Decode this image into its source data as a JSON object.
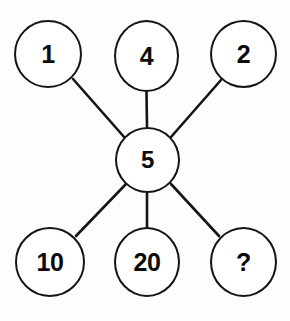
{
  "diagram": {
    "type": "hub-and-spoke",
    "canvas": {
      "width": 290,
      "height": 321,
      "background": "#fdfdfd"
    },
    "stroke_color": "#141414",
    "text_color": "#0b0b0b",
    "fill_color": "#ffffff",
    "center": {
      "id": "center",
      "label": "5",
      "cx": 147.5,
      "cy": 160
    },
    "outer_nodes": [
      {
        "id": "one",
        "label": "1",
        "position": "top-left",
        "cx": 48,
        "cy": 54
      },
      {
        "id": "four",
        "label": "4",
        "position": "top-center",
        "cx": 146.5,
        "cy": 56
      },
      {
        "id": "two",
        "label": "2",
        "position": "top-right",
        "cx": 243.5,
        "cy": 54
      },
      {
        "id": "ten",
        "label": "10",
        "position": "bottom-left",
        "cx": 50,
        "cy": 262
      },
      {
        "id": "twenty",
        "label": "20",
        "position": "bottom-center",
        "cx": 147,
        "cy": 262
      },
      {
        "id": "quest",
        "label": "?",
        "position": "bottom-right",
        "cx": 243.5,
        "cy": 262
      }
    ],
    "edges": [
      {
        "from": "one",
        "to": "center",
        "x1": 73,
        "y1": 79,
        "x2": 125,
        "y2": 138
      },
      {
        "from": "four",
        "to": "center",
        "x1": 146.5,
        "y1": 92,
        "x2": 147,
        "y2": 127
      },
      {
        "from": "two",
        "to": "center",
        "x1": 221,
        "y1": 80,
        "x2": 171,
        "y2": 137
      },
      {
        "from": "ten",
        "to": "center",
        "x1": 76,
        "y1": 236,
        "x2": 126,
        "y2": 184
      },
      {
        "from": "twenty",
        "to": "center",
        "x1": 147,
        "y1": 227,
        "x2": 147,
        "y2": 193
      },
      {
        "from": "quest",
        "to": "center",
        "x1": 219,
        "y1": 236,
        "x2": 171,
        "y2": 184
      }
    ]
  }
}
